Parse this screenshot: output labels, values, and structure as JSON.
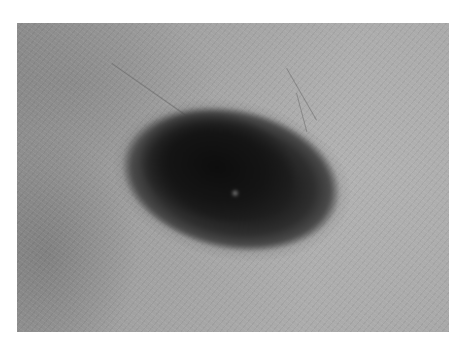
{
  "image": {
    "description": "Grayscale clinical photograph of a dark, irregularly pigmented oval skin lesion on surrounding skin",
    "colors": {
      "page_background": "#ffffff",
      "skin_tone": "#a5a5a5",
      "lesion_core": "#141414",
      "lesion_edge": "#3a3a3a"
    }
  }
}
